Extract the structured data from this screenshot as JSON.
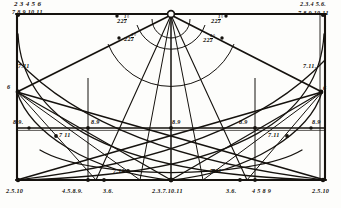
{
  "figure": {
    "kind": "geometric-construction-diagram",
    "medium": "engraved line drawing",
    "ink_color": "#15120e",
    "paper_color": "#fdfdfb",
    "width": 341,
    "height": 208
  },
  "corner_labels": {
    "top_left_upper": "2 3 4 5 6",
    "top_left_lower": "7 8 9 10 11",
    "top_right_upper": "2.3.4 5.6.",
    "top_right_lower": "7.8.9 10.11",
    "bottom_left": "2.5.10",
    "bottom_right": "2.5.10"
  },
  "bottom_labels": {
    "left_inner": "4.5.8.9.",
    "left_mid": "3.6.",
    "center": "2.3.7.10.11",
    "right_mid": "3.6.",
    "right_inner": "4 5 8 9"
  },
  "angle_labels": {
    "outer_left": "22",
    "outer_left_frac_num": "1",
    "outer_left_frac_den": "2",
    "outer_left_deg": "°",
    "inner_left": "22",
    "inner_left_frac_num": "1",
    "inner_left_frac_den": "2",
    "inner_left_deg": "°",
    "inner_right": "22",
    "inner_right_frac_num": "1",
    "inner_right_frac_den": "2",
    "inner_right_deg": "°",
    "outer_right": "22",
    "outer_right_frac_num": "1",
    "outer_right_frac_den": "2",
    "outer_right_deg": "°"
  },
  "side_labels": {
    "upper_left_node": "7.11",
    "upper_left_below": "6",
    "upper_right_node": "7.11.",
    "upper_right_below": "6"
  },
  "midline_labels": {
    "far_left": "8.9.",
    "left": "8.9",
    "center": "8.9",
    "right": "8.9",
    "far_right": "8.9"
  },
  "crossing_labels": {
    "left_upper": "7 11",
    "left_lower": "7.11",
    "right_lower": "7.11",
    "right_upper": "7.11"
  },
  "geometry": {
    "frame": {
      "x": 16,
      "y": 14,
      "w": 310,
      "h": 166
    },
    "apex": {
      "x": 171,
      "y": 15
    },
    "base_center": {
      "x": 171,
      "y": 180
    },
    "midline_y": 128,
    "upper_left_node": {
      "x": 17,
      "y": 92
    },
    "upper_right_node": {
      "x": 322,
      "y": 92
    },
    "left_vertical_x": 88,
    "right_vertical_x": 255,
    "arc_radii": [
      18,
      33,
      63
    ],
    "fan_angles_deg": [
      -67.5,
      -45,
      -22.5,
      0,
      22.5,
      45,
      67.5
    ]
  }
}
